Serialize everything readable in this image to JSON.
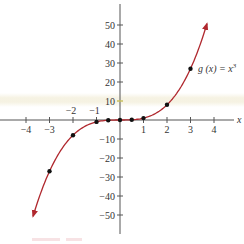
{
  "chart_data": {
    "type": "line",
    "title": "",
    "function_label": "g (x) = x³",
    "function_label_base": "g (x) = x",
    "function_label_exponent": "3",
    "xlabel": "x",
    "ylabel": "",
    "xlim": [
      -4.5,
      4.5
    ],
    "ylim": [
      -60,
      60
    ],
    "x_ticks": [
      -4,
      -3,
      -2,
      -1,
      1,
      2,
      3,
      4
    ],
    "x_tick_labels": [
      "−4",
      "−3",
      "−2",
      "−1",
      "1",
      "2",
      "3",
      "4"
    ],
    "y_ticks": [
      -50,
      -40,
      -30,
      -20,
      -10,
      10,
      20,
      30,
      40,
      50
    ],
    "y_tick_labels": [
      "−50",
      "−40",
      "−30",
      "−20",
      "−10",
      "10",
      "20",
      "30",
      "40",
      "50"
    ],
    "grid": false,
    "legend": "none",
    "series": [
      {
        "name": "g(x) = x^3",
        "color": "#b0282e",
        "curve_x_range": [
          -3.7,
          3.7
        ],
        "arrows": "both-ends",
        "points": [
          {
            "x": -3,
            "y": -27
          },
          {
            "x": -2,
            "y": -8
          },
          {
            "x": -1,
            "y": -1
          },
          {
            "x": -0.5,
            "y": -0.125
          },
          {
            "x": 0,
            "y": 0
          },
          {
            "x": 0.5,
            "y": 0.125
          },
          {
            "x": 1,
            "y": 1
          },
          {
            "x": 2,
            "y": 8
          },
          {
            "x": 3,
            "y": 27
          }
        ]
      }
    ]
  },
  "colors": {
    "curve": "#b0282e",
    "axis": "#555555",
    "points": "#111111",
    "highlight_tick": "#c8c060",
    "text": "#333333"
  }
}
